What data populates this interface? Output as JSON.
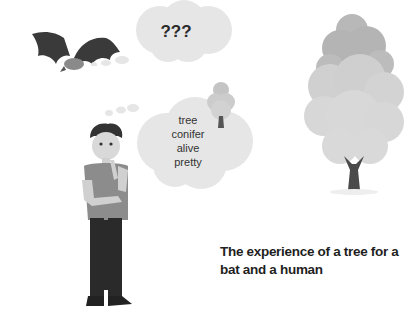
{
  "bat_thought": {
    "text": "???"
  },
  "human_thought": {
    "words": [
      "tree",
      "conifer",
      "alive",
      "pretty"
    ]
  },
  "caption": {
    "line1": "The experience of a tree for a",
    "line2": "bat and a human"
  },
  "colors": {
    "background": "#ffffff",
    "cloud": "#e6e6e6",
    "tree_dark": "#b8b8b8",
    "tree_light": "#d6d6d6",
    "trunk": "#4a4a4a",
    "bat": "#3a3a3a",
    "text": "#222222"
  }
}
